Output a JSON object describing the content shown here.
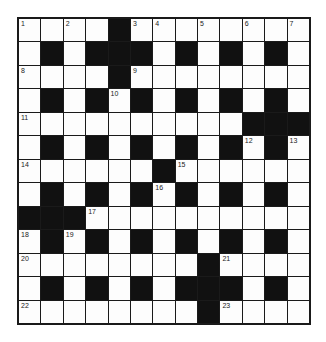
{
  "puzzle": {
    "rows": 13,
    "cols": 13,
    "layout": [
      "....#........",
      ".#.###.#.#.#.",
      "....#........",
      ".#.#.#.#.#.#.",
      "..........###",
      ".#.#.#.#.#.#.",
      "......#......",
      ".#.#.#.#.#.#.",
      "###..........",
      ".#.#.#.#.#.#.",
      "........#....",
      ".#.#.#.###.#.",
      "........#...."
    ],
    "numbers": [
      {
        "r": 0,
        "c": 0,
        "n": "1"
      },
      {
        "r": 0,
        "c": 2,
        "n": "2"
      },
      {
        "r": 0,
        "c": 5,
        "n": "3"
      },
      {
        "r": 0,
        "c": 6,
        "n": "4"
      },
      {
        "r": 0,
        "c": 8,
        "n": "5"
      },
      {
        "r": 0,
        "c": 10,
        "n": "6"
      },
      {
        "r": 0,
        "c": 12,
        "n": "7"
      },
      {
        "r": 2,
        "c": 0,
        "n": "8"
      },
      {
        "r": 2,
        "c": 5,
        "n": "9"
      },
      {
        "r": 3,
        "c": 4,
        "n": "10"
      },
      {
        "r": 4,
        "c": 0,
        "n": "11"
      },
      {
        "r": 5,
        "c": 10,
        "n": "12"
      },
      {
        "r": 5,
        "c": 12,
        "n": "13"
      },
      {
        "r": 6,
        "c": 0,
        "n": "14"
      },
      {
        "r": 6,
        "c": 7,
        "n": "15"
      },
      {
        "r": 7,
        "c": 6,
        "n": "16"
      },
      {
        "r": 8,
        "c": 3,
        "n": "17"
      },
      {
        "r": 9,
        "c": 0,
        "n": "18"
      },
      {
        "r": 9,
        "c": 2,
        "n": "19"
      },
      {
        "r": 10,
        "c": 0,
        "n": "20"
      },
      {
        "r": 10,
        "c": 9,
        "n": "21"
      },
      {
        "r": 12,
        "c": 0,
        "n": "22"
      },
      {
        "r": 12,
        "c": 9,
        "n": "23"
      }
    ],
    "colors": {
      "black_square": "#111111",
      "white_square": "#fdfdfd",
      "grid_line": "#1a1a1a"
    }
  }
}
